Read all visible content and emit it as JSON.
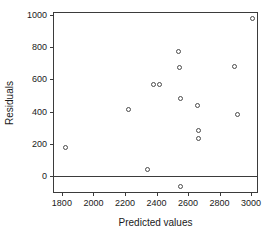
{
  "chart_data": {
    "type": "scatter",
    "title": "",
    "xlabel": "Predicted values",
    "ylabel": "Residuals",
    "xlim": [
      1750,
      3050
    ],
    "ylim": [
      -110,
      1010
    ],
    "xticks": [
      1800,
      2000,
      2200,
      2400,
      2600,
      2800,
      3000
    ],
    "yticks": [
      0,
      200,
      400,
      600,
      800,
      1000
    ],
    "grid": false,
    "legend": null,
    "reference_lines": [
      {
        "axis": "y",
        "value": 0
      }
    ],
    "marker": "open-circle",
    "marker_color": "#4a4a4a",
    "points": [
      {
        "x": 1825,
        "y": 180
      },
      {
        "x": 2225,
        "y": 415
      },
      {
        "x": 2345,
        "y": 40
      },
      {
        "x": 2380,
        "y": 565
      },
      {
        "x": 2420,
        "y": 565
      },
      {
        "x": 2540,
        "y": 770
      },
      {
        "x": 2545,
        "y": 670
      },
      {
        "x": 2550,
        "y": -65
      },
      {
        "x": 2555,
        "y": 480
      },
      {
        "x": 2660,
        "y": 435
      },
      {
        "x": 2665,
        "y": 280
      },
      {
        "x": 2665,
        "y": 235
      },
      {
        "x": 2895,
        "y": 680
      },
      {
        "x": 2915,
        "y": 380
      },
      {
        "x": 3010,
        "y": 975
      }
    ]
  }
}
